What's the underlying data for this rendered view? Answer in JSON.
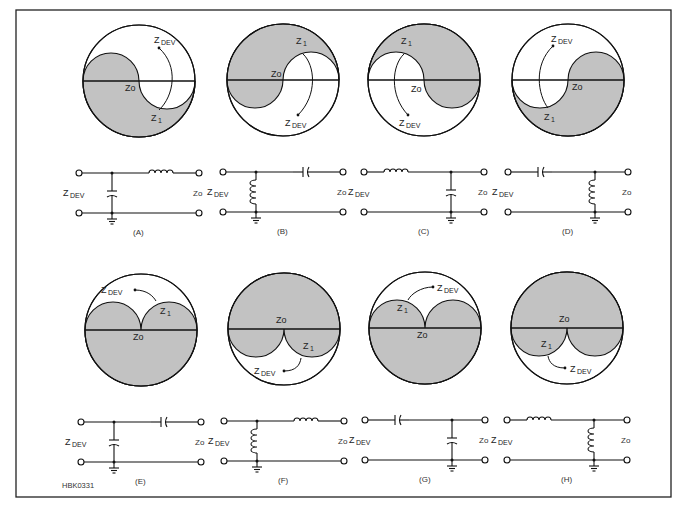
{
  "figure": {
    "id_label": "HBK0331",
    "fill_color": "#c2c2c2",
    "labels": {
      "z_prefix": "Z",
      "dev_sub": "DEV",
      "z1_sub": "1",
      "zo": "Zo"
    }
  },
  "panels": [
    {
      "key": "A",
      "caption": "(A)",
      "cx": 139,
      "cy": 81,
      "r": 56,
      "chart": "s-lower-shaded",
      "z1_pos": "lower",
      "network": {
        "series": "inductor",
        "shunt": "capacitor",
        "shunt_side": "input"
      }
    },
    {
      "key": "B",
      "caption": "(B)",
      "cx": 283,
      "cy": 80,
      "r": 56,
      "chart": "s-upper-shaded",
      "z1_pos": "upper",
      "network": {
        "series": "capacitor",
        "shunt": "inductor",
        "shunt_side": "input"
      }
    },
    {
      "key": "C",
      "caption": "(C)",
      "cx": 424,
      "cy": 80,
      "r": 56,
      "chart": "s-mirror-upper",
      "z1_pos": "upper",
      "network": {
        "series": "inductor",
        "shunt": "capacitor",
        "shunt_side": "output"
      }
    },
    {
      "key": "D",
      "caption": "(D)",
      "cx": 568,
      "cy": 80,
      "r": 56,
      "chart": "s-mirror-lower",
      "z1_pos": "lower",
      "network": {
        "series": "capacitor",
        "shunt": "inductor",
        "shunt_side": "output"
      }
    },
    {
      "key": "E",
      "caption": "(E)",
      "cx": 141,
      "cy": 330,
      "r": 56,
      "chart": "lobes-up",
      "z1_pos": "right",
      "network": {
        "series": "capacitor",
        "shunt": "capacitor",
        "shunt_side": "input"
      }
    },
    {
      "key": "F",
      "caption": "(F)",
      "cx": 284,
      "cy": 329,
      "r": 56,
      "chart": "lobes-down",
      "z1_pos": "right",
      "network": {
        "series": "inductor",
        "shunt": "inductor",
        "shunt_side": "input"
      }
    },
    {
      "key": "G",
      "caption": "(G)",
      "cx": 425,
      "cy": 328,
      "r": 56,
      "chart": "lobes-up",
      "z1_pos": "left",
      "network": {
        "series": "capacitor",
        "shunt": "capacitor",
        "shunt_side": "output"
      }
    },
    {
      "key": "H",
      "caption": "(H)",
      "cx": 567,
      "cy": 328,
      "r": 56,
      "chart": "lobes-down",
      "z1_pos": "left",
      "network": {
        "series": "inductor",
        "shunt": "inductor",
        "shunt_side": "output"
      }
    }
  ]
}
